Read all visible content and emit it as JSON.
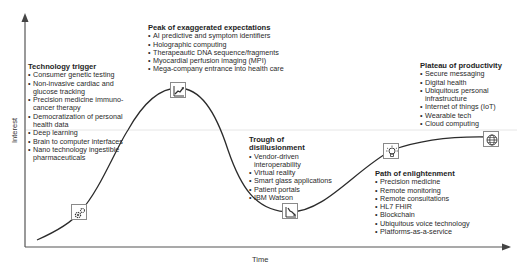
{
  "axes": {
    "x_label": "Time",
    "y_label": "Interest"
  },
  "phases": [
    {
      "title": "Technology trigger",
      "icon": "gears-icon",
      "items": [
        "Consumer genetic testing",
        "Non-invasive cardiac and glucose tracking",
        "Precision medicine immuno-cancer therapy",
        "Democratization of personal health data",
        "Deep learning",
        "Brain to computer interfaces",
        "Nano technology ingestible pharmaceuticals"
      ]
    },
    {
      "title": "Peak of exaggerated expectations",
      "icon": "rising-chart-icon",
      "items": [
        "AI predictive and symptom identifiers",
        "Holographic computing",
        "Therapeautic DNA sequence/fragments",
        "Myocardial perfusion imaging (MPI)",
        "Mega-company entrance into health care"
      ]
    },
    {
      "title": "Trough of disillusionment",
      "icon": "declining-chart-icon",
      "items": [
        "Vendor-driven interoperability",
        "Virtual reality",
        "Smart glass applications",
        "Patient portals",
        "IBM Watson"
      ]
    },
    {
      "title": "Path of enlightenment",
      "icon": "lightbulb-icon",
      "items": [
        "Precision medicine",
        "Remote monitoring",
        "Remote consultations",
        "HL7 FHIR",
        "Blockchain",
        "Ubiquitous voice technology",
        "Platforms-as-a-service"
      ]
    },
    {
      "title": "Plateau of productivity",
      "icon": "globe-icon",
      "items": [
        "Secure messaging",
        "Digital health",
        "Ubiquitous personal infrastructure",
        "Internet of things (IoT)",
        "Wearable tech",
        "Cloud computing"
      ]
    }
  ],
  "colors": {
    "curve": "#2b2b2b",
    "axis": "#555555",
    "icon_border": "#8a8a8a",
    "text": "#2a2a2a"
  }
}
